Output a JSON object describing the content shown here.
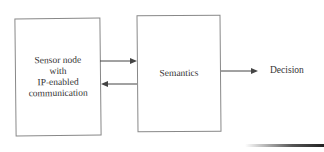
{
  "diagram": {
    "nodes": [
      {
        "id": "sensor",
        "label_lines": [
          "Sensor node",
          "with",
          "IP-enabled",
          "communication"
        ]
      },
      {
        "id": "semantics",
        "label": "Semantics"
      },
      {
        "id": "decision",
        "label": "Decision"
      }
    ],
    "edges": [
      {
        "from": "sensor",
        "to": "semantics",
        "direction": "right"
      },
      {
        "from": "semantics",
        "to": "sensor",
        "direction": "left"
      },
      {
        "from": "semantics",
        "to": "decision",
        "direction": "right"
      }
    ],
    "colors": {
      "stroke": "#888888",
      "arrow": "#444444",
      "text": "#333333"
    }
  }
}
